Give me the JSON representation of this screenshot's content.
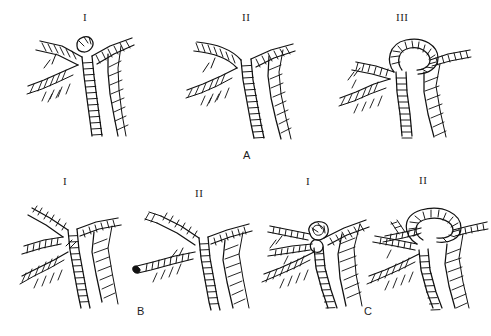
{
  "figure": {
    "type": "anatomical-line-drawing",
    "background_color": "#ffffff",
    "ink_color": "#111111",
    "rows": 2,
    "groups": [
      {
        "id": "A",
        "label": "A",
        "label_x": 243,
        "label_y": 150,
        "panels": [
          {
            "id": "A-I",
            "label": "I",
            "label_x": 83,
            "label_y": 12
          },
          {
            "id": "A-II",
            "label": "II",
            "label_x": 243,
            "label_y": 12
          },
          {
            "id": "A-III",
            "label": "III",
            "label_x": 398,
            "label_y": 12
          }
        ]
      },
      {
        "id": "B",
        "label": "B",
        "label_x": 138,
        "label_y": 308,
        "panels": [
          {
            "id": "B-I",
            "label": "I",
            "label_x": 63,
            "label_y": 176
          },
          {
            "id": "B-II",
            "label": "II",
            "label_x": 196,
            "label_y": 188
          }
        ]
      },
      {
        "id": "C",
        "label": "C",
        "label_x": 365,
        "label_y": 308,
        "panels": [
          {
            "id": "C-I",
            "label": "I",
            "label_x": 307,
            "label_y": 176
          },
          {
            "id": "C-II",
            "label": "II",
            "label_x": 420,
            "label_y": 175
          }
        ]
      }
    ]
  }
}
